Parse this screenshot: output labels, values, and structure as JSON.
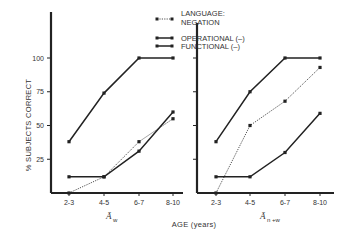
{
  "chart_data": [
    {
      "type": "line",
      "panel": "left",
      "xlabel_symbol": "Ā",
      "xlabel_subscript": "w",
      "ylabel": "% SUBJECTS CORRECT",
      "categories": [
        "2-3",
        "4-5",
        "6-7",
        "8-10"
      ],
      "yticks": [
        25,
        50,
        75,
        100
      ],
      "ylim": [
        0,
        100
      ],
      "grid": false,
      "series": [
        {
          "name": "FUNCTIONAL (–)",
          "style": "solid",
          "values": [
            38,
            74,
            100,
            100
          ]
        },
        {
          "name": "OPERATIONAL (–)",
          "style": "solid",
          "values": [
            12,
            12,
            31,
            60
          ]
        },
        {
          "name": "LANGUAGE: NEGATION",
          "style": "dotted",
          "values": [
            0,
            12,
            38,
            55
          ]
        }
      ]
    },
    {
      "type": "line",
      "panel": "right",
      "xlabel_symbol": "Ā",
      "xlabel_subscript": "n+w",
      "ylabel": "% SUBJECTS CORRECT",
      "categories": [
        "2-3",
        "4-5",
        "6-7",
        "8-10"
      ],
      "yticks": [
        25,
        50,
        75,
        100
      ],
      "ylim": [
        0,
        100
      ],
      "grid": false,
      "series": [
        {
          "name": "FUNCTIONAL (–)",
          "style": "solid",
          "values": [
            38,
            75,
            100,
            100
          ]
        },
        {
          "name": "LANGUAGE: NEGATION",
          "style": "dotted",
          "values": [
            0,
            50,
            68,
            93
          ]
        },
        {
          "name": "OPERATIONAL (–)",
          "style": "solid",
          "values": [
            12,
            12,
            30,
            59
          ]
        }
      ]
    }
  ],
  "legend": {
    "items": [
      {
        "label_line1": "LANGUAGE:",
        "label_line2": "NEGATION",
        "style": "dotted"
      },
      {
        "label_line1": "OPERATIONAL (–)",
        "style": "solid"
      },
      {
        "label_line1": "FUNCTIONAL (–)",
        "style": "solid"
      }
    ]
  },
  "axes": {
    "ylabel": "% SUBJECTS CORRECT",
    "xlabel": "AGE (years)",
    "left_sub": {
      "symbol": "Ā",
      "subscript": "w"
    },
    "right_sub": {
      "symbol": "Ā",
      "subscript": "n +w"
    },
    "ytick_labels": [
      "100",
      "75",
      "50",
      "25"
    ],
    "xtick_labels": [
      "2-3",
      "4-5",
      "6-7",
      "8-10"
    ]
  },
  "colors": {
    "ink": "#222222",
    "background": "#ffffff"
  }
}
